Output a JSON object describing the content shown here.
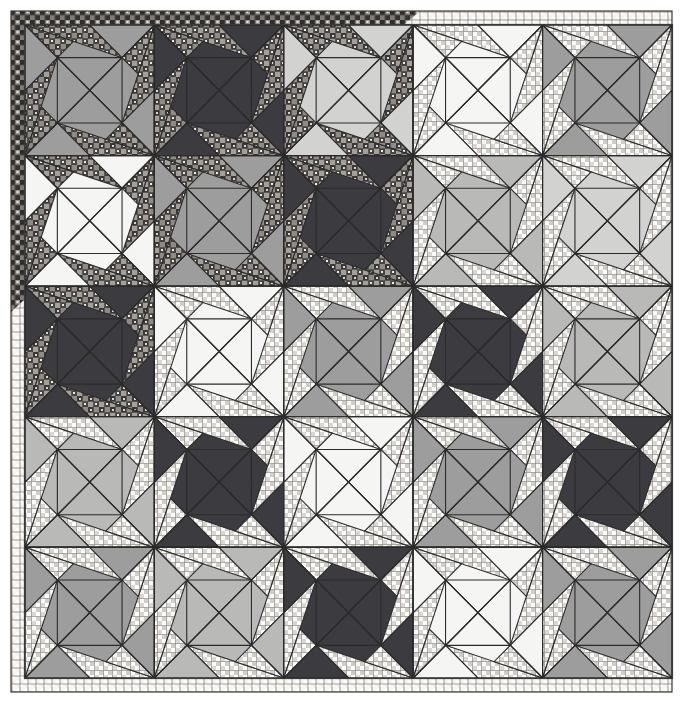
{
  "artwork": {
    "title": "Pieced Patchwork Quilt Photograph",
    "subject": "quilt",
    "medium": "photograph",
    "tone": "black-and-white / grayscale",
    "canvas": {
      "width": 680,
      "height": 703
    },
    "background_color": "#ffffff"
  },
  "quilt": {
    "name": "pinwheel-star patchwork quilt",
    "grid_rows": 5,
    "grid_cols": 5,
    "block_name": "quarter-square pinwheel block",
    "quadrants_per_block": 4,
    "field": {
      "x": 25,
      "y": 25,
      "width": 647,
      "height": 653
    },
    "binding_label": "pieced scrap binding",
    "binding_width": 13,
    "binding_dark_print_color": "#4a4744",
    "binding_light_grid_color": "#f2f2ef",
    "binding_note": "dark scrappy print along upper-left edges transitioning to light grid print along lower-right edges",
    "seam_line_color": "#2b2b2b",
    "seam_line_width": 1.1
  },
  "palette": {
    "dark": "#3c3c40",
    "medium": "#9d9d9e",
    "light_medium": "#b9b9b8",
    "pale": "#d2d2d0",
    "white": "#f5f5f3",
    "print_dark": "#555250",
    "print_light": "#eceae6",
    "print_dark_accent": "#8d8a86",
    "print_light_accent": "#b4b2ae",
    "outline": "#2b2b2b",
    "paper": "#ffffff"
  },
  "legend": {
    "solid_fabrics": [
      "dark navy solid",
      "medium gray solid",
      "light gray solid",
      "pale gray solid",
      "off-white solid"
    ],
    "print_fabrics": [
      "dark multicolor square print",
      "light multicolor square print"
    ]
  },
  "chart_data": {
    "type": "heatmap",
    "xlabel": "column",
    "ylabel": "row",
    "categories_x": [
      "1",
      "2",
      "3",
      "4",
      "5"
    ],
    "categories_y": [
      "1",
      "2",
      "3",
      "4",
      "5"
    ],
    "legend": [
      "dark",
      "medium",
      "light_medium",
      "pale",
      "white"
    ],
    "grid": [
      [
        "medium",
        "dark",
        "pale",
        "white",
        "medium"
      ],
      [
        "white",
        "medium",
        "dark",
        "light_medium",
        "pale"
      ],
      [
        "dark",
        "white",
        "medium",
        "dark",
        "light_medium"
      ],
      [
        "light_medium",
        "dark",
        "white",
        "medium",
        "dark"
      ],
      [
        "medium",
        "light_medium",
        "dark",
        "white",
        "medium"
      ]
    ],
    "print_grid": [
      [
        "dark",
        "dark",
        "dark",
        "light",
        "light"
      ],
      [
        "dark",
        "dark",
        "dark",
        "light",
        "light"
      ],
      [
        "dark",
        "light",
        "light",
        "light",
        "light"
      ],
      [
        "light",
        "light",
        "light",
        "light",
        "light"
      ],
      [
        "light",
        "light",
        "light",
        "light",
        "light"
      ]
    ]
  }
}
